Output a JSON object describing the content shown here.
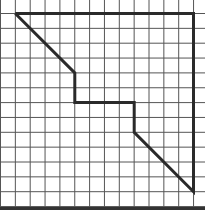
{
  "diagram": {
    "type": "grid-polygon",
    "grid": {
      "columns": 14,
      "rows": 13,
      "cell_size": 14.85,
      "origin_x": 0.5,
      "origin_y": 13.5,
      "line_color": "#555555",
      "background": "#ffffff"
    },
    "bottom_border_color": "#333333",
    "shape": {
      "stroke": "#2a2a2a",
      "stroke_width": 3,
      "vertices_grid": [
        [
          1,
          0
        ],
        [
          13,
          0
        ],
        [
          13,
          12
        ],
        [
          9,
          8
        ],
        [
          9,
          6
        ],
        [
          5,
          6
        ],
        [
          5,
          4
        ],
        [
          1,
          0
        ]
      ]
    }
  }
}
